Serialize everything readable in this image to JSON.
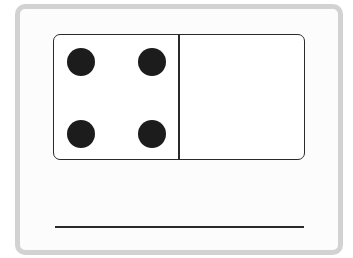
{
  "domino": {
    "left_half": {
      "dots": 4,
      "positions": [
        [
          13,
          13
        ],
        [
          84,
          13
        ],
        [
          13,
          85
        ],
        [
          84,
          85
        ]
      ]
    },
    "right_half": {
      "dots": 0
    }
  },
  "answer": {
    "value": ""
  },
  "colors": {
    "border": "#d2d2d2",
    "ink": "#1c1c1c"
  }
}
